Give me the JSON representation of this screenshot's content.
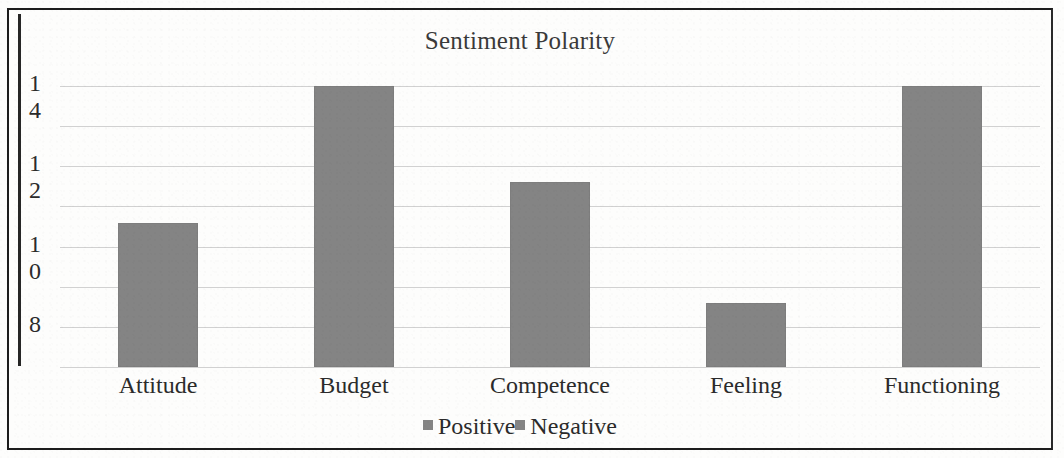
{
  "chart_data": {
    "type": "bar",
    "title": "Sentiment Polarity",
    "xlabel": "",
    "ylabel": "",
    "categories": [
      "Attitude",
      "Budget",
      "Competence",
      "Feeling",
      "Functioning"
    ],
    "series": [
      {
        "name": "Positive",
        "values": [
          10.6,
          14.0,
          11.6,
          8.6,
          14.0
        ]
      }
    ],
    "legend": [
      {
        "label": "Positive",
        "color": "#848484"
      },
      {
        "label": "Negative",
        "color": "#848484"
      }
    ],
    "legend_position": "bottom",
    "y_ticks": [
      {
        "label": "14",
        "digits": [
          "1",
          "4"
        ],
        "value": 14
      },
      {
        "label": "12",
        "digits": [
          "1",
          "2"
        ],
        "value": 12
      },
      {
        "label": "10",
        "digits": [
          "1",
          "0"
        ],
        "value": 10
      },
      {
        "label": "8",
        "digits": [
          "8"
        ],
        "value": 8
      }
    ],
    "ylim": [
      7,
      14
    ],
    "gridline_count": 8,
    "grid": true,
    "bar_color": "#848484",
    "axis_color": "#262626",
    "grid_color": "#c9c9c9",
    "border_color": "#1d1d1d"
  }
}
